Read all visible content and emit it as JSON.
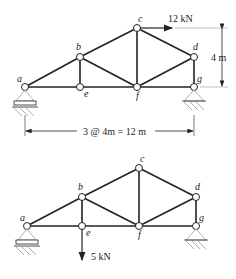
{
  "diagrams": [
    {
      "id": "truss-top",
      "nodes": {
        "a": "a",
        "b": "b",
        "c": "c",
        "d": "d",
        "e": "e",
        "f": "f",
        "g": "g"
      },
      "load": {
        "label": "12 kN",
        "node": "c",
        "direction": "right"
      },
      "height_dim": "4 m",
      "span_dim": "3 @ 4m = 12 m"
    },
    {
      "id": "truss-bottom",
      "nodes": {
        "a": "a",
        "b": "b",
        "c": "c",
        "d": "d",
        "e": "e",
        "f": "f",
        "g": "g"
      },
      "load": {
        "label": "5 kN",
        "node": "e",
        "direction": "down"
      }
    }
  ],
  "colors": {
    "line": "#222222",
    "hatch": "#999999"
  }
}
